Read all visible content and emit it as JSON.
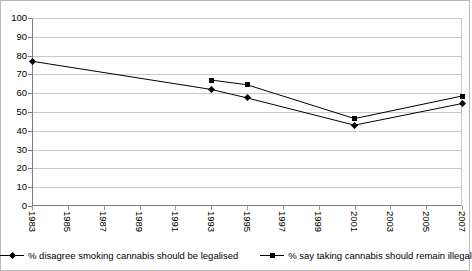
{
  "chart_data": {
    "type": "line",
    "title": "",
    "subtitle": "",
    "xlabel": "",
    "ylabel": "",
    "ylim": [
      0,
      100
    ],
    "ystep": 10,
    "ytick_labels": [
      "0",
      "10",
      "20",
      "30",
      "40",
      "50",
      "60",
      "70",
      "80",
      "90",
      "100"
    ],
    "grid": "horizontal",
    "legend_position": "bottom",
    "x": [
      1983,
      1985,
      1987,
      1989,
      1991,
      1993,
      1995,
      1997,
      1999,
      2001,
      2003,
      2005,
      2007
    ],
    "xtick_labels": [
      "1983",
      "1985",
      "1987",
      "1989",
      "1991",
      "1993",
      "1995",
      "1997",
      "1999",
      "2001",
      "2003",
      "2005",
      "2007"
    ],
    "series": [
      {
        "name": "% disagree smoking cannabis should be legalised",
        "marker": "diamond",
        "color": "#000000",
        "points": [
          {
            "x": 1983,
            "y": 77
          },
          {
            "x": 1993,
            "y": 62
          },
          {
            "x": 1995,
            "y": 57.5
          },
          {
            "x": 2001,
            "y": 43
          },
          {
            "x": 2007,
            "y": 54.5
          }
        ]
      },
      {
        "name": "% say taking cannabis should remain illegal",
        "marker": "square",
        "color": "#000000",
        "points": [
          {
            "x": 1993,
            "y": 67
          },
          {
            "x": 1995,
            "y": 64.5
          },
          {
            "x": 2001,
            "y": 46.5
          },
          {
            "x": 2007,
            "y": 58.5
          }
        ]
      }
    ]
  },
  "legend": {
    "items": [
      {
        "label": "% disagree smoking cannabis should be legalised",
        "marker": "diamond"
      },
      {
        "label": "% say taking cannabis should remain illegal",
        "marker": "square"
      }
    ]
  }
}
